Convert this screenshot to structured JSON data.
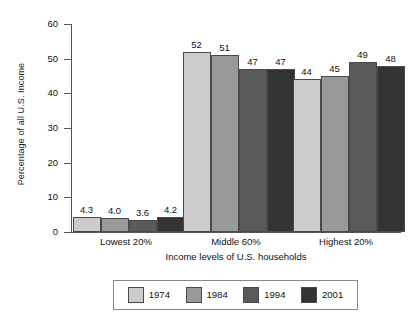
{
  "chart_data": {
    "type": "bar",
    "title": "",
    "xlabel": "Income levels of U.S. households",
    "ylabel": "Percentage of all U.S. Income",
    "categories": [
      "Lowest 20%",
      "Middle 60%",
      "Highest 20%"
    ],
    "series": [
      {
        "name": "1974",
        "color": "#cccccc",
        "values": [
          4.3,
          52,
          44
        ],
        "labels": [
          "4.3",
          "52",
          "44"
        ]
      },
      {
        "name": "1984",
        "color": "#999999",
        "values": [
          4.0,
          51,
          45
        ],
        "labels": [
          "4.0",
          "51",
          "45"
        ]
      },
      {
        "name": "1994",
        "color": "#5a5a5a",
        "values": [
          3.6,
          47,
          49
        ],
        "labels": [
          "3.6",
          "47",
          "49"
        ]
      },
      {
        "name": "2001",
        "color": "#333333",
        "values": [
          4.2,
          47,
          48
        ],
        "labels": [
          "4.2",
          "47",
          "48"
        ]
      }
    ],
    "ylim": [
      0,
      60
    ],
    "yticks": [
      0,
      10,
      20,
      30,
      40,
      50,
      60
    ],
    "ytick_labels": [
      "0",
      "10",
      "20",
      "30",
      "40",
      "50",
      "60"
    ],
    "grid": false,
    "legend_position": "bottom"
  }
}
